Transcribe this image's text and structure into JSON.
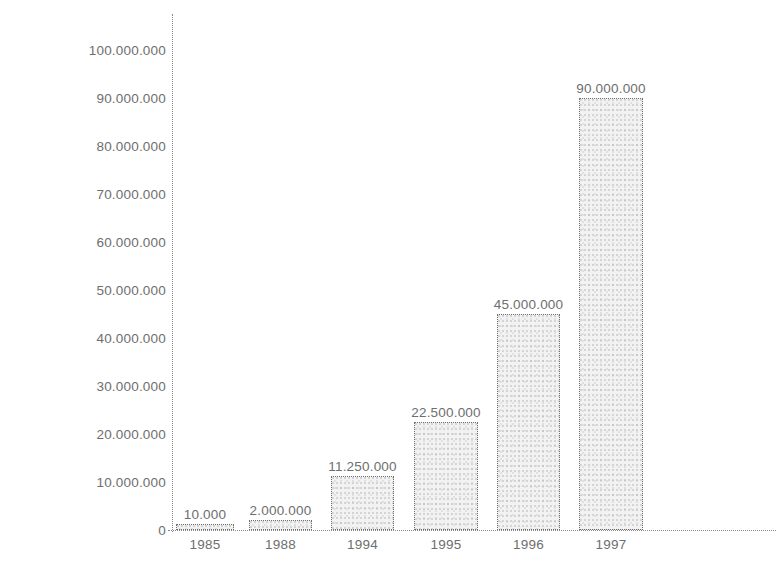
{
  "chart_data": {
    "type": "bar",
    "title": "",
    "xlabel": "",
    "ylabel": "Benutzer",
    "categories": [
      "1985",
      "1988",
      "1994",
      "1995",
      "1996",
      "1997"
    ],
    "values": [
      10000,
      2000000,
      11250000,
      22500000,
      45000000,
      90000000
    ],
    "value_labels": [
      "10.000",
      "2.000.000",
      "11.250.000",
      "22.500.000",
      "45.000.000",
      "90.000.000"
    ],
    "ylim": [
      0,
      100000000
    ],
    "ytick_values": [
      0,
      10000000,
      20000000,
      30000000,
      40000000,
      50000000,
      60000000,
      70000000,
      80000000,
      90000000,
      100000000
    ],
    "ytick_labels": [
      "0",
      "10.000.000",
      "20.000.000",
      "30.000.000",
      "40.000.000",
      "50.000.000",
      "60.000.000",
      "70.000.000",
      "80.000.000",
      "90.000.000",
      "100.000.000"
    ],
    "grid": false,
    "legend": null,
    "series": [
      {
        "name": "Benutzer",
        "values": [
          10000,
          2000000,
          11250000,
          22500000,
          45000000,
          90000000
        ]
      }
    ],
    "colors": {
      "bar_fill": "#f2f2f2",
      "bar_border": "#707070",
      "axis": "#8a8a8a",
      "text": "#6e6e6e",
      "background": "#ffffff"
    }
  }
}
